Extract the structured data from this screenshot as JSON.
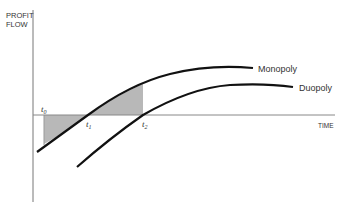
{
  "axes": {
    "y_label_line1": "PROFIT",
    "y_label_line2": "FLOW",
    "x_label": "TIME"
  },
  "ticks": {
    "t0": "t",
    "t0_sub": "0",
    "t1": "t",
    "t1_sub": "1",
    "t2": "t",
    "t2_sub": "2"
  },
  "curves": {
    "monopoly": "Monopoly",
    "duopoly": "Duopoly"
  },
  "colors": {
    "curve": "#111111",
    "axis": "#777777",
    "shade": "#b8b8b8"
  }
}
